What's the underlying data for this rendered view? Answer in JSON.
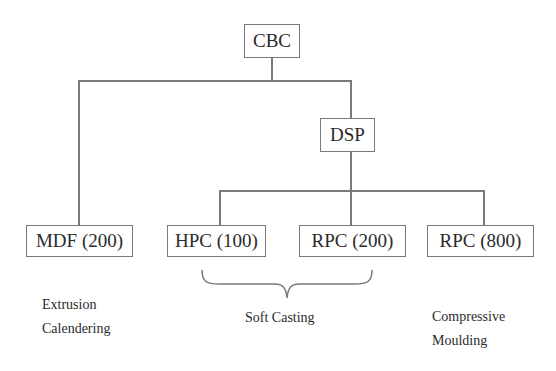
{
  "diagram": {
    "root": {
      "label": "CBC"
    },
    "mid": {
      "label": "DSP"
    },
    "leaves": [
      {
        "label": "MDF (200)"
      },
      {
        "label": "HPC (100)"
      },
      {
        "label": "RPC (200)"
      },
      {
        "label": "RPC (800)"
      }
    ],
    "process_labels": {
      "left": [
        "Extrusion",
        "Calendering"
      ],
      "center": "Soft Casting",
      "right": [
        "Compressive",
        "Moulding"
      ]
    },
    "colors": {
      "line": "#7a7a7a",
      "text": "#2b2b2b",
      "background": "#ffffff"
    }
  }
}
